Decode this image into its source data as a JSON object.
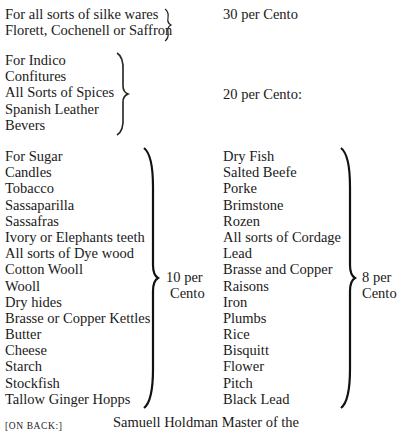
{
  "group1": {
    "items": [
      "For all sorts of silke wares",
      "Florett, Cochenell or Saffron"
    ],
    "rate": "30 per Cento"
  },
  "group2": {
    "items": [
      "For Indico",
      "Confitures",
      "All Sorts of Spices",
      "Spanish Leather",
      "Bevers"
    ],
    "rate": "20 per Cento:"
  },
  "group3": {
    "items": [
      "For Sugar",
      "Candles",
      "Tobacco",
      "Sassaparilla",
      "Sassafras",
      "Ivory or Elephants teeth",
      "All sorts of Dye wood",
      "Cotton Wooll",
      "Wooll",
      "Dry hides",
      "Brasse or Copper Kettles",
      "Butter",
      "Cheese",
      "Starch",
      "Stockfish",
      "Tallow Ginger Hopps"
    ],
    "rate_line1": "10 per",
    "rate_line2": "Cento"
  },
  "group4": {
    "items": [
      "Dry Fish",
      "Salted Beefe",
      "Porke",
      "Brimstone",
      "Rozen",
      "All sorts of Cordage",
      "Lead",
      "Brasse and Copper",
      "Raisons",
      "Iron",
      "Plumbs",
      "Rice",
      "Bisquitt",
      "Flower",
      "Pitch",
      "Black Lead"
    ],
    "rate_line1": "8 per",
    "rate_line2": "Cento"
  },
  "footer": {
    "label": "[ON BACK:]",
    "text": "Samuell Holdman Master of the"
  }
}
